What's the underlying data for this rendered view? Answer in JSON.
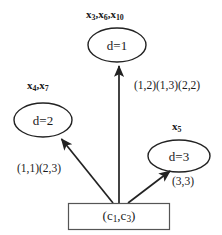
{
  "diagram": {
    "stroke_color": "#222222",
    "text_color": "#1a1a1a",
    "background": "#ffffff",
    "nodes": [
      {
        "id": "d1",
        "shape": "ellipse",
        "label": "d=1",
        "tag": "x3,x6,x10",
        "tag_parts": [
          "x",
          "3",
          ",x",
          "6",
          ",x",
          "10"
        ],
        "cx": 117,
        "cy": 45,
        "rx": 29,
        "ry": 17
      },
      {
        "id": "d2",
        "shape": "ellipse",
        "label": "d=2",
        "tag": "x4,x7",
        "tag_parts": [
          "x",
          "4",
          ",x",
          "7"
        ],
        "cx": 43,
        "cy": 120,
        "rx": 29,
        "ry": 17
      },
      {
        "id": "d3",
        "shape": "ellipse",
        "label": "d=3",
        "tag": "x5",
        "tag_parts": [
          "x",
          "5"
        ],
        "cx": 179,
        "cy": 156,
        "rx": 31,
        "ry": 16
      },
      {
        "id": "source",
        "shape": "rectangle",
        "label": "(c1,c3)",
        "x": 68,
        "y": 203,
        "width": 102,
        "height": 27
      }
    ],
    "edges": [
      {
        "id": "edge-to-d1",
        "from": "source",
        "to": "d1",
        "label": "(1,2)(1,3)(2,2)",
        "x1": 119,
        "y1": 203,
        "x2": 119,
        "y2": 64
      },
      {
        "id": "edge-to-d2",
        "from": "source",
        "to": "d2",
        "label": "(1,1)(2,3)",
        "x1": 113,
        "y1": 203,
        "x2": 59,
        "y2": 136
      },
      {
        "id": "edge-to-d3",
        "from": "source",
        "to": "d3",
        "label": "(3,3)",
        "x1": 128,
        "y1": 203,
        "x2": 172,
        "y2": 169
      }
    ]
  },
  "labels": {
    "node_d1": "d=1",
    "node_d2": "d=2",
    "node_d3": "d=3",
    "box_text": "(c",
    "box_sub1": "1",
    "box_mid": ",c",
    "box_sub2": "3",
    "box_end": ")",
    "tag_d1_a": "x",
    "tag_d1_s1": "3",
    "tag_d1_b": ",x",
    "tag_d1_s2": "6",
    "tag_d1_c": ",x",
    "tag_d1_s3": "10",
    "tag_d2_a": "x",
    "tag_d2_s1": "4",
    "tag_d2_b": ",x",
    "tag_d2_s2": "7",
    "tag_d3_a": "x",
    "tag_d3_s1": "5",
    "edge_d1_label": "(1,2)(1,3)(2,2)",
    "edge_d2_label": "(1,1)(2,3)",
    "edge_d3_label": "(3,3)"
  }
}
